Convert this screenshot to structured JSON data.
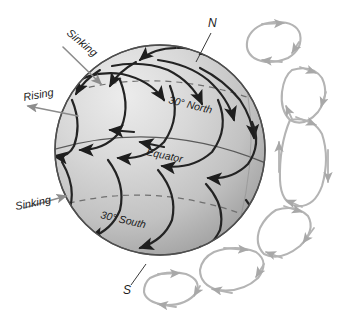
{
  "figure": {
    "background_color": "#ffffff",
    "width": 345,
    "height": 318
  },
  "globe": {
    "name": "earth-sphere",
    "center_x": 160,
    "center_y": 150,
    "radius": 105,
    "fill_light": "#e9e9e9",
    "fill_mid": "#c9c9c9",
    "fill_dark": "#9a9a9a",
    "outline_color": "#4a4a4a"
  },
  "latitude_lines": [
    {
      "id": "lat-30-north",
      "label": "30° North",
      "latitude_deg": 30,
      "style": "dashed",
      "label_x": 168,
      "label_y": 101,
      "label_rotation": 12
    },
    {
      "id": "lat-equator",
      "label": "Equator",
      "latitude_deg": 0,
      "style": "solid",
      "label_x": 143,
      "label_y": 153,
      "label_rotation": 11
    },
    {
      "id": "lat-30-south",
      "label": "30° South",
      "latitude_deg": -30,
      "style": "dashed",
      "label_x": 100,
      "label_y": 216,
      "label_rotation": 11
    }
  ],
  "pole_labels": [
    {
      "id": "pole-north",
      "label": "N",
      "x": 212,
      "y": 24
    },
    {
      "id": "pole-south",
      "label": "S",
      "x": 126,
      "y": 292
    }
  ],
  "vertical_motion_labels": [
    {
      "id": "sinking-north",
      "label": "Sinking",
      "x": 66,
      "y": 34,
      "rotation": 38,
      "arrow_direction": "toward-globe-down-right"
    },
    {
      "id": "rising-equator",
      "label": "Rising",
      "x": 24,
      "y": 100,
      "rotation": 0,
      "arrow_direction": "away-from-globe-down-left"
    },
    {
      "id": "sinking-south",
      "label": "Sinking",
      "x": 16,
      "y": 208,
      "rotation": -12,
      "arrow_direction": "toward-globe-up-right"
    }
  ],
  "circulation_cells": {
    "description": "Side-view convection cell loops drawn outside the right limb of the globe",
    "stroke_color": "#b0b0b0",
    "count": 6,
    "cells": [
      {
        "id": "cell-polar-north",
        "hemisphere": "north",
        "type": "polar"
      },
      {
        "id": "cell-ferrel-north",
        "hemisphere": "north",
        "type": "ferrel"
      },
      {
        "id": "cell-hadley-north",
        "hemisphere": "north",
        "type": "hadley"
      },
      {
        "id": "cell-hadley-south",
        "hemisphere": "south",
        "type": "hadley"
      },
      {
        "id": "cell-ferrel-south",
        "hemisphere": "south",
        "type": "ferrel"
      },
      {
        "id": "cell-polar-south",
        "hemisphere": "south",
        "type": "polar"
      }
    ]
  },
  "surface_winds": {
    "description": "Curved arrows on the globe surface showing deflected surface wind belts",
    "stroke_color": "#222222"
  }
}
